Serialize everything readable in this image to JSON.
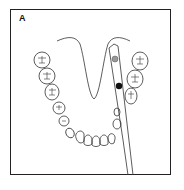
{
  "panel": {
    "label": "A",
    "subject": "mandibular dental arch with periodontal probe",
    "colors": {
      "outline": "#333333",
      "frame": "#222222",
      "marker_upper": "#999999",
      "marker_lower": "#111111"
    },
    "elements": {
      "tongue_outline": "tongue-outline",
      "teeth_left": [
        "molar",
        "molar",
        "molar",
        "premolar",
        "premolar",
        "canine"
      ],
      "teeth_right": [
        "molar",
        "molar",
        "molar",
        "premolar",
        "canine"
      ],
      "incisors": 4,
      "probe": "periodontal-probe",
      "markers": [
        "gray-marker",
        "black-marker"
      ]
    }
  }
}
